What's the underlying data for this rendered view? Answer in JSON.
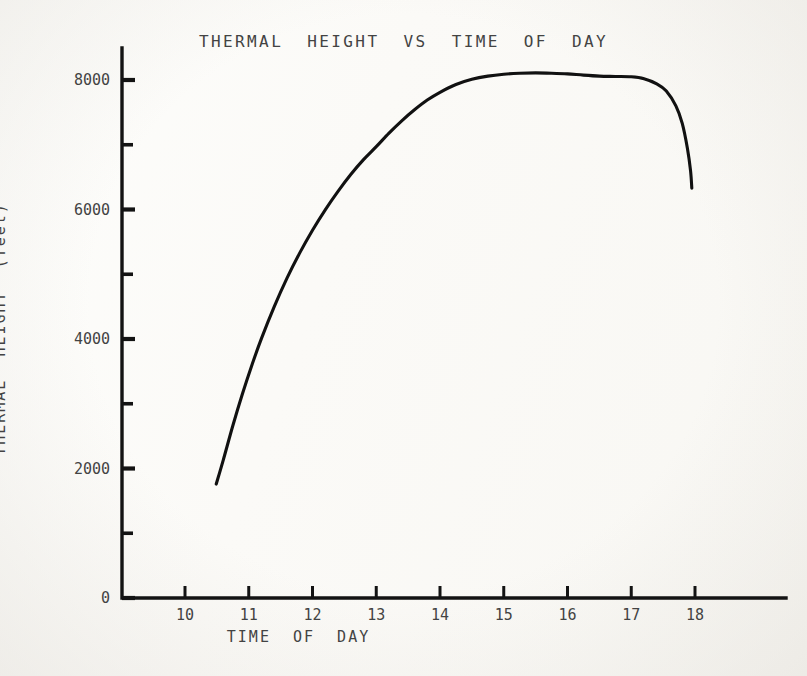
{
  "chart_data": {
    "type": "line",
    "title": "THERMAL  HEIGHT  VS  TIME  OF  DAY",
    "xlabel": "TIME  OF  DAY",
    "ylabel": "THERMAL  HEIGHT  (feet)",
    "xlim": [
      9.3,
      19.4
    ],
    "ylim": [
      0,
      8280
    ],
    "x_ticks": [
      10,
      11,
      12,
      13,
      14,
      15,
      16,
      17,
      18
    ],
    "x_tick_labels": [
      "10",
      "11",
      "12",
      "13",
      "14",
      "15",
      "16",
      "17",
      "18"
    ],
    "y_ticks": [
      0,
      1000,
      2000,
      3000,
      4000,
      5000,
      6000,
      7000,
      8000
    ],
    "y_tick_labels": [
      "0",
      "",
      "2000",
      "",
      "4000",
      "",
      "6000",
      "",
      "8000"
    ],
    "y_major_ticks": [
      0,
      2000,
      4000,
      6000,
      8000
    ],
    "y_minor_ticks": [
      1000,
      3000,
      5000,
      7000
    ],
    "grid": false,
    "legend": false,
    "line_color": "#111111",
    "line_width": 3.1,
    "series": [
      {
        "name": "Thermal height",
        "x": [
          10.49,
          10.6,
          10.75,
          10.9,
          11.05,
          11.2,
          11.4,
          11.6,
          11.8,
          12.0,
          12.2,
          12.4,
          12.6,
          12.8,
          13.0,
          13.2,
          13.4,
          13.6,
          13.8,
          14.0,
          14.25,
          14.5,
          14.75,
          15.0,
          15.25,
          15.5,
          15.75,
          16.0,
          16.25,
          16.5,
          16.75,
          17.0,
          17.2,
          17.4,
          17.55,
          17.7,
          17.8,
          17.88,
          17.93,
          17.95
        ],
        "y": [
          1760,
          2130,
          2660,
          3150,
          3600,
          4010,
          4500,
          4940,
          5330,
          5680,
          5995,
          6280,
          6540,
          6770,
          6970,
          7180,
          7370,
          7540,
          7690,
          7810,
          7930,
          8010,
          8060,
          8090,
          8105,
          8110,
          8105,
          8095,
          8075,
          8060,
          8055,
          8050,
          8020,
          7940,
          7830,
          7600,
          7330,
          6950,
          6600,
          6330
        ]
      }
    ],
    "annotations": []
  },
  "axes": {
    "x_axis_name": "x-axis",
    "y_axis_name": "y-axis"
  }
}
